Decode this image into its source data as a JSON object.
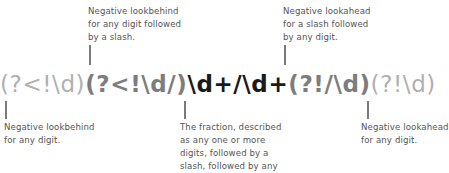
{
  "regex": {
    "segments": [
      {
        "id": "lookbehind-digit",
        "text": "(?<!\\d)",
        "tone": "light"
      },
      {
        "id": "lookbehind-digit-slash",
        "text": "(?<!\\d/)",
        "tone": "mid"
      },
      {
        "id": "fraction",
        "text": "\\d+/\\d+",
        "tone": "dark"
      },
      {
        "id": "lookahead-slash-digit",
        "text": "(?!/\\d)",
        "tone": "mid"
      },
      {
        "id": "lookahead-digit",
        "text": "(?!\\d)",
        "tone": "light"
      }
    ]
  },
  "annotations": {
    "top_left": "Negative lookbehind\nfor any digit followed\nby a slash.",
    "top_right": "Negative lookahead\nfor a slash followed\nby any digit.",
    "bottom_left": "Negative lookbehind\nfor any digit.",
    "bottom_middle": "The fraction, described\nas any one or more\ndigits, followed by a\nslash, followed by any",
    "bottom_right": "Negative lookahead\nfor any digit."
  },
  "colors": {
    "light": "#b0b0b0",
    "mid": "#7d7d7d",
    "dark": "#1a1a1a",
    "note_text": "#555555",
    "leader_line": "#7a7a7a"
  }
}
